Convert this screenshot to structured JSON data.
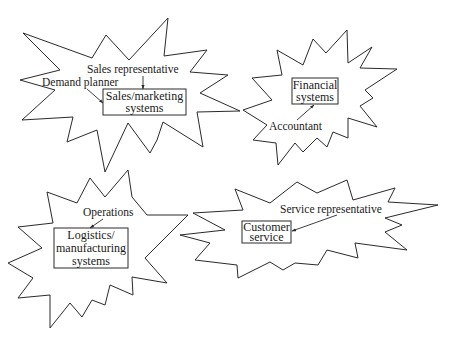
{
  "diagram": {
    "type": "organizational-silos",
    "clusters": [
      {
        "id": "sales",
        "system": {
          "lines": [
            "Sales/marketing",
            "systems"
          ]
        },
        "actors": [
          {
            "label": "Sales representative"
          },
          {
            "label": "Demand planner"
          }
        ]
      },
      {
        "id": "financial",
        "system": {
          "lines": [
            "Financial",
            "systems"
          ]
        },
        "actors": [
          {
            "label": "Accountant"
          }
        ]
      },
      {
        "id": "logistics",
        "system": {
          "lines": [
            "Logistics/",
            "manufacturing",
            "systems"
          ]
        },
        "actors": [
          {
            "label": "Operations"
          }
        ]
      },
      {
        "id": "customer-service",
        "system": {
          "lines": [
            "Customer",
            "service"
          ]
        },
        "actors": [
          {
            "label": "Service representative"
          }
        ]
      }
    ],
    "colors": {
      "stroke": "#2a2a2a",
      "background": "#ffffff",
      "text": "#1a1a1a"
    }
  }
}
